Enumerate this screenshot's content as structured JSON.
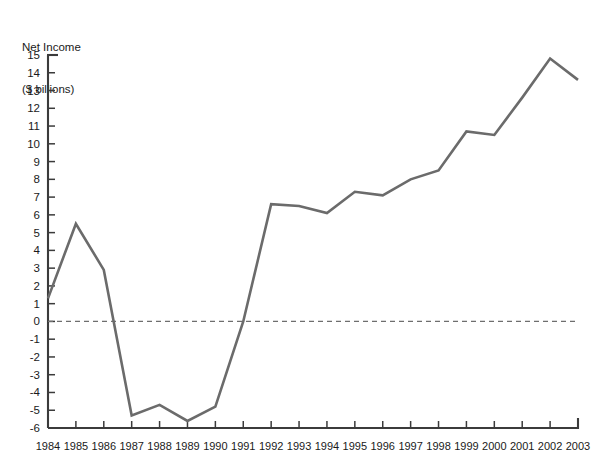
{
  "chart_data": {
    "type": "line",
    "title": "Net Income",
    "subtitle": "($ billions)",
    "xlabel": "",
    "ylabel": "Net Income ($ billions)",
    "categories": [
      "1984",
      "1985",
      "1986",
      "1987",
      "1988",
      "1989",
      "1990",
      "1991",
      "1992",
      "1993",
      "1994",
      "1995",
      "1996",
      "1997",
      "1998",
      "1999",
      "2000",
      "2001",
      "2002",
      "2003"
    ],
    "values": [
      1.3,
      5.5,
      2.9,
      -5.3,
      -4.7,
      -5.6,
      -4.8,
      0.0,
      6.6,
      6.5,
      6.1,
      7.3,
      7.1,
      8.0,
      8.5,
      10.7,
      10.5,
      12.6,
      14.8,
      13.6
    ],
    "ylim": [
      -6,
      15
    ],
    "yticks": [
      15,
      14,
      13,
      12,
      11,
      10,
      9,
      8,
      7,
      6,
      5,
      4,
      3,
      2,
      1,
      0,
      -1,
      -2,
      -3,
      -4,
      -5,
      -6
    ],
    "ytick_labels": [
      "15",
      "14",
      "13",
      "12",
      "11",
      "10",
      "9",
      "8",
      "7",
      "6",
      "5",
      "4",
      "3",
      "2",
      "1",
      "0",
      "-1",
      "-2",
      "-3",
      "-4",
      "-5",
      "-6"
    ],
    "grid": false,
    "legend": null,
    "zero_reference_line": 0,
    "zero_line_style": "dashed",
    "line_color": "#6b6b6b",
    "axis_color": "#3b3b3b",
    "background_color": "#ffffff"
  }
}
